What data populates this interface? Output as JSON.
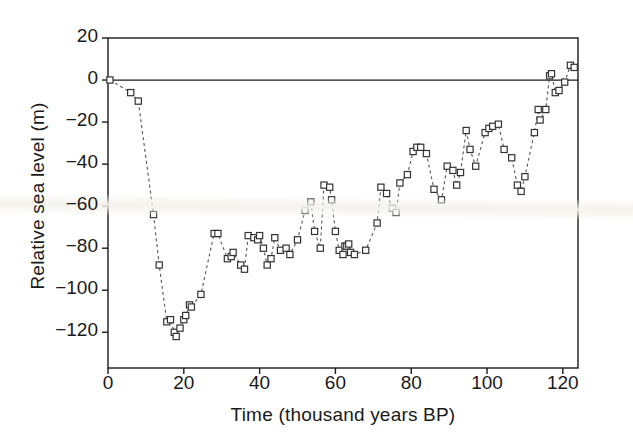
{
  "chart_data": {
    "type": "scatter",
    "title": "",
    "subtitle": "",
    "xlabel": "Time (thousand years BP)",
    "ylabel": "Relative sea level (m)",
    "xlim": [
      0,
      124
    ],
    "ylim": [
      -137,
      20
    ],
    "xticks": [
      0,
      20,
      40,
      60,
      80,
      100,
      120
    ],
    "xtick_labels": [
      "0",
      "20",
      "40",
      "60",
      "80",
      "100",
      "120"
    ],
    "yticks": [
      20,
      0,
      -20,
      -40,
      -60,
      -80,
      -100,
      -120
    ],
    "ytick_labels": [
      "20",
      "0",
      "-20",
      "-40",
      "-60",
      "-80",
      "-100",
      "-120"
    ],
    "grid": false,
    "legend": null,
    "annotations": [
      {
        "name": "zero-reference-line",
        "type": "hline",
        "y": 0
      }
    ],
    "series": [
      {
        "name": "Relative sea level",
        "marker": "open-square",
        "marker_color": "#333333",
        "line_style": "dashed",
        "line_color": "#555555",
        "x": [
          0.5,
          6,
          8,
          12,
          13.5,
          15.5,
          16.5,
          17.5,
          18,
          19,
          20,
          20.5,
          21.5,
          22,
          24.5,
          28,
          29,
          31.5,
          32.5,
          33,
          35,
          36,
          37,
          38.5,
          39.5,
          40,
          41,
          42,
          43,
          44,
          45.5,
          47,
          48,
          50,
          52,
          53.5,
          54.5,
          56,
          57,
          58.5,
          59,
          60,
          61,
          62,
          62.5,
          63,
          63.5,
          64,
          65,
          68,
          71,
          72,
          73.5,
          75,
          76,
          77,
          79,
          80.5,
          81.5,
          82.5,
          84,
          86,
          88,
          89.5,
          91,
          92,
          93,
          94.5,
          95.5,
          97,
          99.5,
          100.5,
          101.5,
          103,
          104.5,
          106.5,
          108,
          109,
          110,
          112.5,
          113.5,
          114,
          115.5,
          116.5,
          117,
          118,
          119,
          120.5,
          122,
          123
        ],
        "y": [
          0,
          -6,
          -10,
          -64,
          -88,
          -115,
          -114,
          -120,
          -122,
          -118,
          -114,
          -112,
          -107,
          -108,
          -102,
          -73,
          -73,
          -85,
          -84,
          -82,
          -88,
          -90,
          -74,
          -75,
          -76,
          -74,
          -80,
          -88,
          -85,
          -75,
          -81,
          -80,
          -83,
          -76,
          -62,
          -58,
          -72,
          -80,
          -50,
          -51,
          -57,
          -72,
          -81,
          -83,
          -79,
          -79,
          -78,
          -82,
          -83,
          -81,
          -68,
          -51,
          -54,
          -61,
          -63,
          -49,
          -45,
          -34,
          -32,
          -32,
          -35,
          -52,
          -57,
          -41,
          -43,
          -50,
          -44,
          -24,
          -33,
          -41,
          -25,
          -23,
          -22,
          -21,
          -33,
          -37,
          -50,
          -53,
          -46,
          -25,
          -14,
          -19,
          -14,
          2,
          3,
          -6,
          -5,
          -1,
          7,
          6
        ]
      }
    ]
  },
  "axis": {
    "ylabel_text": "Relative sea level (m)",
    "xlabel_text": "Time (thousand years BP)"
  }
}
